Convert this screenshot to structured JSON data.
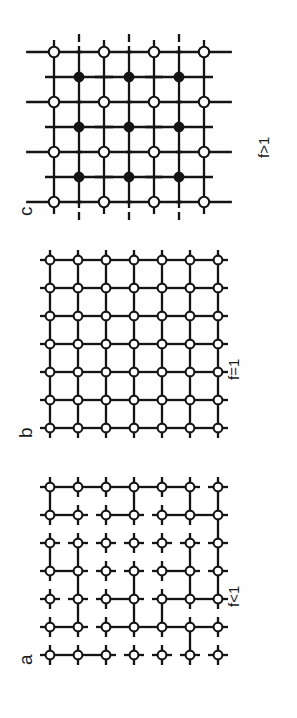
{
  "figure": {
    "type": "lattice-diagram-figure",
    "background": "#ffffff",
    "ink": "#141414",
    "orientation_deg": -90,
    "panel_count": 3
  },
  "panels": [
    {
      "id": "panel-c",
      "letter": "c",
      "caption": "f>1",
      "description": "compressed square lattice with extra interstitial filled nodes",
      "grid": {
        "open_cols": 4,
        "open_rows": 4,
        "filled_cols": 3,
        "filled_rows": 3
      },
      "node_styles": {
        "open": "open-circle",
        "filled": "filled-circle"
      },
      "spacing_px": 50
    },
    {
      "id": "panel-b",
      "letter": "b",
      "caption": "f=1",
      "description": "perfect fully connected square lattice",
      "grid": {
        "open_cols": 7,
        "open_rows": 7,
        "filled_cols": 0,
        "filled_rows": 0
      },
      "node_styles": {
        "open": "open-circle",
        "filled": "none"
      },
      "spacing_px": 28
    },
    {
      "id": "panel-a",
      "letter": "a",
      "caption": "f<1",
      "description": "dilute square lattice with missing bonds",
      "grid": {
        "open_cols": 7,
        "open_rows": 7,
        "filled_cols": 0,
        "filled_rows": 0
      },
      "node_styles": {
        "open": "open-circle",
        "filled": "none"
      },
      "spacing_px": 28
    }
  ],
  "chart_data": {
    "type": "diagram",
    "title": "",
    "subtitle": "",
    "xlabel": "",
    "ylabel": "",
    "legend": [],
    "annotations": [
      "a",
      "b",
      "c",
      "f<1",
      "f=1",
      "f>1"
    ],
    "series": [
      {
        "name": "panel-a",
        "label": "a",
        "caption": "f<1",
        "nodes_open": 49,
        "nodes_filled": 0,
        "bond_fraction": "less than 1",
        "h_bonds": [
          [
            0,
            0,
            0,
            1,
            0,
            1
          ],
          [
            0,
            1,
            1,
            1,
            0,
            0
          ],
          [
            0,
            0,
            0,
            0,
            0,
            0
          ],
          [
            0,
            1,
            1,
            0,
            0,
            1
          ],
          [
            0,
            1,
            0,
            0,
            0,
            0
          ],
          [
            1,
            0,
            1,
            1,
            0,
            1
          ],
          [
            0,
            0,
            1,
            1,
            1,
            1
          ]
        ],
        "v_bonds": [
          [
            1,
            1,
            0,
            1,
            0,
            1,
            1
          ],
          [
            1,
            0,
            0,
            0,
            0,
            0,
            1
          ],
          [
            0,
            1,
            1,
            0,
            0,
            1,
            1
          ],
          [
            0,
            1,
            0,
            0,
            0,
            0,
            1
          ],
          [
            0,
            1,
            1,
            1,
            0,
            1,
            1
          ],
          [
            0,
            1,
            1,
            0,
            0,
            1,
            0
          ]
        ]
      },
      {
        "name": "panel-b",
        "label": "b",
        "caption": "f=1",
        "nodes_open": 49,
        "nodes_filled": 0,
        "bond_fraction": "equal to 1",
        "h_bonds": [
          [
            1,
            1,
            1,
            1,
            1,
            1
          ],
          [
            1,
            1,
            1,
            1,
            1,
            1
          ],
          [
            1,
            1,
            1,
            1,
            1,
            1
          ],
          [
            1,
            1,
            1,
            1,
            1,
            1
          ],
          [
            1,
            1,
            1,
            1,
            1,
            1
          ],
          [
            1,
            1,
            1,
            1,
            1,
            1
          ],
          [
            1,
            1,
            1,
            1,
            1,
            1
          ]
        ],
        "v_bonds": [
          [
            1,
            1,
            1,
            1,
            1,
            1,
            1
          ],
          [
            1,
            1,
            1,
            1,
            1,
            1,
            1
          ],
          [
            1,
            1,
            1,
            1,
            1,
            1,
            1
          ],
          [
            1,
            1,
            1,
            1,
            1,
            1,
            1
          ],
          [
            1,
            1,
            1,
            1,
            1,
            1,
            1
          ],
          [
            1,
            1,
            1,
            1,
            1,
            1,
            1
          ]
        ]
      },
      {
        "name": "panel-c",
        "label": "c",
        "caption": "f>1",
        "nodes_open": 16,
        "nodes_filled": 9,
        "bond_fraction": "greater than 1",
        "open_h_bonds": [
          [
            1,
            1,
            1
          ],
          [
            1,
            1,
            1
          ],
          [
            1,
            1,
            1
          ],
          [
            1,
            1,
            1
          ]
        ],
        "filled_h_bonds": [
          [
            1,
            1
          ],
          [
            1,
            1
          ],
          [
            1,
            1
          ]
        ]
      }
    ]
  }
}
